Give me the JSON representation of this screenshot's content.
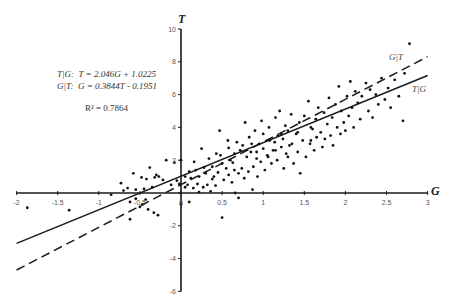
{
  "chart_data": {
    "type": "scatter",
    "title": "",
    "xlabel": "G",
    "ylabel": "T",
    "xlim": [
      -2,
      3
    ],
    "ylim": [
      -6,
      10
    ],
    "x_ticks": [
      "-2",
      "-1.5",
      "-1",
      "-0.5",
      "0",
      "0.5",
      "1",
      "1.5",
      "2",
      "2.5",
      "3"
    ],
    "y_ticks": [
      "-6",
      "-4",
      "-2",
      "0",
      "2",
      "4",
      "6",
      "8",
      "10"
    ],
    "grid": false,
    "annotations": {
      "eq1": "T|G:  T = 2.046G + 1.0225",
      "eq2": "G|T:  G = 0.3844T - 0.1951",
      "r2": "R² = 0.7864"
    },
    "series": [
      {
        "name": "T|G",
        "kind": "line",
        "style": "solid",
        "slope": 2.046,
        "intercept": 1.0225,
        "label": "T|G"
      },
      {
        "name": "G|T",
        "kind": "line",
        "style": "dashed",
        "slope": 2.6015,
        "intercept": 0.5075,
        "label": "G|T"
      },
      {
        "name": "observations",
        "kind": "points",
        "points": [
          [
            -1.87,
            -0.9
          ],
          [
            -1.36,
            -1.05
          ],
          [
            -0.85,
            -0.1
          ],
          [
            -0.73,
            0.6
          ],
          [
            -0.62,
            -0.55
          ],
          [
            -0.62,
            -1.6
          ],
          [
            -0.58,
            1.2
          ],
          [
            -0.55,
            -0.35
          ],
          [
            -0.5,
            -0.85
          ],
          [
            -0.48,
            0.95
          ],
          [
            -0.47,
            -0.7
          ],
          [
            -0.45,
            0.25
          ],
          [
            -0.43,
            -0.4
          ],
          [
            -0.42,
            0.85
          ],
          [
            -0.4,
            -1.0
          ],
          [
            -0.38,
            1.55
          ],
          [
            -0.35,
            0.35
          ],
          [
            -0.33,
            -1.2
          ],
          [
            -0.32,
            0.95
          ],
          [
            -0.3,
            1.1
          ],
          [
            -0.28,
            -1.35
          ],
          [
            -0.27,
            1.0
          ],
          [
            -0.22,
            0.8
          ],
          [
            -0.18,
            2.0
          ],
          [
            -0.12,
            0.5
          ],
          [
            -0.08,
            1.85
          ],
          [
            -0.05,
            0.75
          ],
          [
            -0.02,
            0.55
          ],
          [
            0.0,
            2.0
          ],
          [
            0.0,
            -0.7
          ],
          [
            0.05,
            0.35
          ],
          [
            0.08,
            0.5
          ],
          [
            0.1,
            -0.55
          ],
          [
            0.12,
            0.9
          ],
          [
            0.15,
            0.3
          ],
          [
            0.18,
            1.4
          ],
          [
            0.2,
            0.55
          ],
          [
            0.22,
            1.0
          ],
          [
            0.25,
            2.7
          ],
          [
            0.27,
            0.35
          ],
          [
            0.3,
            1.2
          ],
          [
            0.32,
            0.5
          ],
          [
            0.34,
            2.1
          ],
          [
            0.36,
            0.1
          ],
          [
            0.38,
            1.6
          ],
          [
            0.4,
            1.0
          ],
          [
            0.42,
            0.45
          ],
          [
            0.45,
            1.25
          ],
          [
            0.47,
            3.8
          ],
          [
            0.48,
            2.3
          ],
          [
            0.5,
            1.8
          ],
          [
            0.5,
            -1.5
          ],
          [
            0.52,
            0.8
          ],
          [
            0.55,
            1.5
          ],
          [
            0.57,
            3.2
          ],
          [
            0.58,
            1.1
          ],
          [
            0.6,
            2.0
          ],
          [
            0.62,
            0.65
          ],
          [
            0.63,
            1.85
          ],
          [
            0.65,
            2.4
          ],
          [
            0.66,
            0.0
          ],
          [
            0.68,
            3.1
          ],
          [
            0.7,
            1.2
          ],
          [
            0.7,
            -0.3
          ],
          [
            0.72,
            2.6
          ],
          [
            0.74,
            1.5
          ],
          [
            0.75,
            2.9
          ],
          [
            0.77,
            0.9
          ],
          [
            0.78,
            4.3
          ],
          [
            0.8,
            2.2
          ],
          [
            0.82,
            1.3
          ],
          [
            0.83,
            3.4
          ],
          [
            0.85,
            2.5
          ],
          [
            0.87,
            0.2
          ],
          [
            0.88,
            1.6
          ],
          [
            0.9,
            3.8
          ],
          [
            0.92,
            2.1
          ],
          [
            0.93,
            1.0
          ],
          [
            0.95,
            3.0
          ],
          [
            0.97,
            1.9
          ],
          [
            0.98,
            4.4
          ],
          [
            1.0,
            2.7
          ],
          [
            1.0,
            3.6
          ],
          [
            1.02,
            1.4
          ],
          [
            1.05,
            2.3
          ],
          [
            1.07,
            4.0
          ],
          [
            1.08,
            3.2
          ],
          [
            1.1,
            1.8
          ],
          [
            1.12,
            2.6
          ],
          [
            1.14,
            3.1
          ],
          [
            1.15,
            4.6
          ],
          [
            1.17,
            2.0
          ],
          [
            1.18,
            3.5
          ],
          [
            1.2,
            5.0
          ],
          [
            1.22,
            2.8
          ],
          [
            1.24,
            3.3
          ],
          [
            1.25,
            1.5
          ],
          [
            1.27,
            4.1
          ],
          [
            1.28,
            2.4
          ],
          [
            1.3,
            3.8
          ],
          [
            1.32,
            2.9
          ],
          [
            1.34,
            4.8
          ],
          [
            1.35,
            3.0
          ],
          [
            1.37,
            1.8
          ],
          [
            1.4,
            3.6
          ],
          [
            1.42,
            2.5
          ],
          [
            1.44,
            4.3
          ],
          [
            1.45,
            1.2
          ],
          [
            1.48,
            3.2
          ],
          [
            1.5,
            4.7
          ],
          [
            1.52,
            2.2
          ],
          [
            1.55,
            5.6
          ],
          [
            1.57,
            3.0
          ],
          [
            1.58,
            4.0
          ],
          [
            1.6,
            3.9
          ],
          [
            1.62,
            2.6
          ],
          [
            1.64,
            4.5
          ],
          [
            1.65,
            3.4
          ],
          [
            1.67,
            5.2
          ],
          [
            1.7,
            3.7
          ],
          [
            1.72,
            2.8
          ],
          [
            1.74,
            4.9
          ],
          [
            1.75,
            3.3
          ],
          [
            1.78,
            4.2
          ],
          [
            1.8,
            5.8
          ],
          [
            1.82,
            3.5
          ],
          [
            1.84,
            4.6
          ],
          [
            1.85,
            2.9
          ],
          [
            1.88,
            5.4
          ],
          [
            1.9,
            4.0
          ],
          [
            1.92,
            6.5
          ],
          [
            1.94,
            3.6
          ],
          [
            1.95,
            5.0
          ],
          [
            1.98,
            4.3
          ],
          [
            2.0,
            3.8
          ],
          [
            2.02,
            5.9
          ],
          [
            2.04,
            4.7
          ],
          [
            2.06,
            6.8
          ],
          [
            2.08,
            5.2
          ],
          [
            2.1,
            4.0
          ],
          [
            2.12,
            6.2
          ],
          [
            2.15,
            5.5
          ],
          [
            2.18,
            4.5
          ],
          [
            2.2,
            5.9
          ],
          [
            2.25,
            6.7
          ],
          [
            2.28,
            5.0
          ],
          [
            2.3,
            6.3
          ],
          [
            2.33,
            4.6
          ],
          [
            2.37,
            6.0
          ],
          [
            2.4,
            5.4
          ],
          [
            2.44,
            7.0
          ],
          [
            2.48,
            5.7
          ],
          [
            2.52,
            6.4
          ],
          [
            2.55,
            5.2
          ],
          [
            2.6,
            6.9
          ],
          [
            2.65,
            5.9
          ],
          [
            2.7,
            4.4
          ],
          [
            2.72,
            7.3
          ],
          [
            2.78,
            9.1
          ],
          [
            -0.7,
            0.15
          ],
          [
            -0.55,
            0.2
          ],
          [
            -0.65,
            0.3
          ],
          [
            0.1,
            1.3
          ],
          [
            0.16,
            1.9
          ],
          [
            0.05,
            1.0
          ],
          [
            0.28,
            1.55
          ],
          [
            0.58,
            2.75
          ],
          [
            0.86,
            3.0
          ],
          [
            1.06,
            2.2
          ],
          [
            1.15,
            2.6
          ],
          [
            1.3,
            2.2
          ],
          [
            1.42,
            3.7
          ],
          [
            1.58,
            3.2
          ],
          [
            0.43,
            2.4
          ],
          [
            0.38,
            0.85
          ],
          [
            0.22,
            0.05
          ],
          [
            0.65,
            1.4
          ],
          [
            0.92,
            2.5
          ],
          [
            1.22,
            3.6
          ]
        ]
      }
    ]
  },
  "labels": {
    "x_axis_title": "G",
    "y_axis_title": "T",
    "line_label_gt": "G|T",
    "line_label_tg": "T|G",
    "eq1_prefix": "T|G:",
    "eq1_body": "T = 2.046G + 1.0225",
    "eq2_prefix": "G|T:",
    "eq2_body": "G = 0.3844T - 0.1951",
    "r2": "R² = 0.7864"
  },
  "colors": {
    "axis": "#1a1a1a",
    "point": "#111111",
    "line": "#1a1a1a",
    "tick_label": "#555555"
  }
}
